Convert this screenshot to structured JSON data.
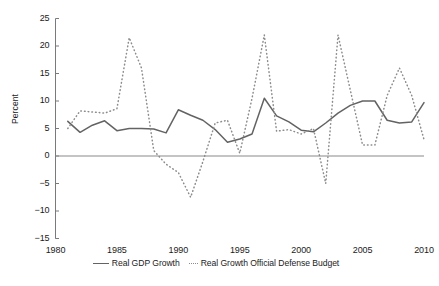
{
  "chart_data": {
    "type": "line",
    "title": "",
    "xlabel": "",
    "ylabel": "Percent",
    "xlim": [
      1980,
      2010
    ],
    "ylim": [
      -15,
      25
    ],
    "grid": false,
    "legend_position": "bottom-center",
    "yticks": [
      25,
      20,
      15,
      10,
      5,
      0,
      -5,
      -10,
      -15
    ],
    "xticks": [
      1980,
      1985,
      1990,
      1995,
      2000,
      2005,
      2010
    ],
    "zero_line": 0,
    "x": [
      1981,
      1982,
      1983,
      1984,
      1985,
      1986,
      1987,
      1988,
      1989,
      1990,
      1991,
      1992,
      1993,
      1994,
      1995,
      1996,
      1997,
      1998,
      1999,
      2000,
      2001,
      2002,
      2003,
      2004,
      2005,
      2006,
      2007,
      2008,
      2009,
      2010
    ],
    "series": [
      {
        "name": "Real GDP Growth",
        "style": "solid",
        "color": "#636363",
        "values": [
          6.3,
          4.3,
          5.6,
          6.4,
          4.6,
          5.0,
          5.0,
          4.9,
          4.9,
          4.3,
          6.1,
          7.6,
          8.4,
          7.5,
          6.4,
          5.0,
          4.2,
          4.9,
          5.8,
          7.6,
          8.8,
          9.6,
          10.5,
          8.2,
          5.0,
          4.2,
          4.6,
          5.2,
          7.0,
          9.7
        ],
        "approx_points": [
          [
            1981,
            6.3
          ],
          [
            1982,
            4.3
          ],
          [
            1983,
            5.6
          ],
          [
            1984,
            6.4
          ],
          [
            1985,
            4.6
          ],
          [
            1986,
            5.0
          ],
          [
            1987,
            5.0
          ],
          [
            1988,
            4.9
          ],
          [
            1989,
            4.2
          ],
          [
            1990,
            8.4
          ],
          [
            1991,
            7.4
          ],
          [
            1992,
            6.5
          ],
          [
            1993,
            4.8
          ],
          [
            1994,
            2.5
          ],
          [
            1995,
            3.1
          ],
          [
            1996,
            4.0
          ],
          [
            1997,
            10.5
          ],
          [
            1998,
            7.3
          ],
          [
            1999,
            6.2
          ],
          [
            2000,
            4.7
          ],
          [
            2001,
            4.4
          ],
          [
            2002,
            6.0
          ],
          [
            2003,
            7.8
          ],
          [
            2004,
            9.2
          ],
          [
            2005,
            10.0
          ],
          [
            2006,
            10.0
          ],
          [
            2007,
            6.5
          ],
          [
            2008,
            6.0
          ],
          [
            2009,
            6.2
          ],
          [
            2010,
            9.7
          ]
        ]
      },
      {
        "name": "Real Growth Official Defense Budget",
        "style": "dotted",
        "color": "#8c8c8c",
        "values": [
          5.0,
          8.2,
          8.0,
          7.5,
          8.6,
          21.5,
          16.0,
          3.0,
          -1.5,
          -2.5,
          -7.5,
          3.5,
          4.5,
          2.5,
          0.5,
          10.0,
          22.0,
          4.5,
          5.0,
          4.0,
          5.0,
          -5.0,
          22.0,
          12.0,
          6.0,
          2.0,
          11.0,
          16.0,
          11.0,
          3.0
        ],
        "approx_points": [
          [
            1981,
            5.0
          ],
          [
            1982,
            8.2
          ],
          [
            1983,
            8.0
          ],
          [
            1984,
            7.8
          ],
          [
            1985,
            8.6
          ],
          [
            1986,
            21.5
          ],
          [
            1987,
            16.0
          ],
          [
            1988,
            1.0
          ],
          [
            1989,
            -1.5
          ],
          [
            1990,
            -3.0
          ],
          [
            1991,
            -7.5
          ],
          [
            1992,
            -1.0
          ],
          [
            1993,
            6.0
          ],
          [
            1994,
            6.5
          ],
          [
            1995,
            0.5
          ],
          [
            1996,
            10.5
          ],
          [
            1997,
            22.0
          ],
          [
            1998,
            4.5
          ],
          [
            1999,
            4.8
          ],
          [
            2000,
            4.0
          ],
          [
            2001,
            5.0
          ],
          [
            2002,
            -5.0
          ],
          [
            2003,
            22.0
          ],
          [
            2004,
            12.0
          ],
          [
            2005,
            2.0
          ],
          [
            2006,
            2.0
          ],
          [
            2007,
            11.0
          ],
          [
            2008,
            16.0
          ],
          [
            2009,
            11.0
          ],
          [
            2010,
            3.0
          ]
        ]
      }
    ]
  },
  "legend": {
    "entries": [
      {
        "label": "Real GDP Growth",
        "style": "solid"
      },
      {
        "label": "Real Growth Official Defense Budget",
        "style": "dotted"
      }
    ]
  },
  "caption": {
    "text": ""
  }
}
